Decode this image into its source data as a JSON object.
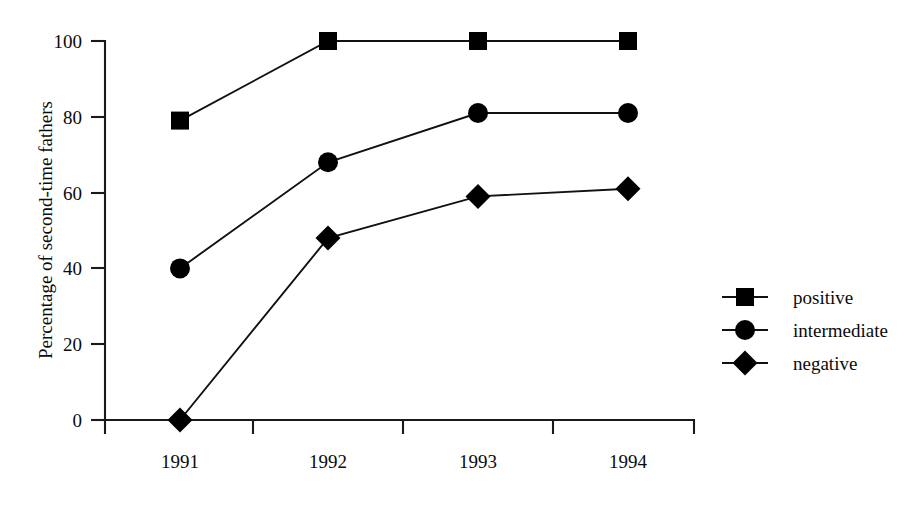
{
  "chart_data": {
    "type": "line",
    "title": "",
    "xlabel": "",
    "ylabel": "Percentage of second-time fathers",
    "categories": [
      "1991",
      "1992",
      "1993",
      "1994"
    ],
    "ylim": [
      0,
      100
    ],
    "yticks": [
      0,
      20,
      40,
      60,
      80,
      100
    ],
    "ytick_labels": [
      "0",
      "20",
      "40",
      "60",
      "80",
      "100"
    ],
    "grid": false,
    "legend_position": "right",
    "series": [
      {
        "name": "positive",
        "marker": "square",
        "values": [
          79,
          100,
          100,
          100
        ]
      },
      {
        "name": "intermediate",
        "marker": "circle",
        "values": [
          40,
          68,
          81,
          81
        ]
      },
      {
        "name": "negative",
        "marker": "diamond",
        "values": [
          0,
          48,
          59,
          61
        ]
      }
    ]
  },
  "axes": {
    "y_title": "Percentage of second-time fathers",
    "y_tick_0": "0",
    "y_tick_20": "20",
    "y_tick_40": "40",
    "y_tick_60": "60",
    "y_tick_80": "80",
    "y_tick_100": "100",
    "x_tick_1991": "1991",
    "x_tick_1992": "1992",
    "x_tick_1993": "1993",
    "x_tick_1994": "1994"
  },
  "legend": {
    "entries": [
      {
        "label": "positive",
        "marker": "square"
      },
      {
        "label": "intermediate",
        "marker": "circle"
      },
      {
        "label": "negative",
        "marker": "diamond"
      }
    ]
  },
  "colors": {
    "ink": "#000000",
    "axis": "#1a1a1a",
    "background": "#ffffff"
  }
}
